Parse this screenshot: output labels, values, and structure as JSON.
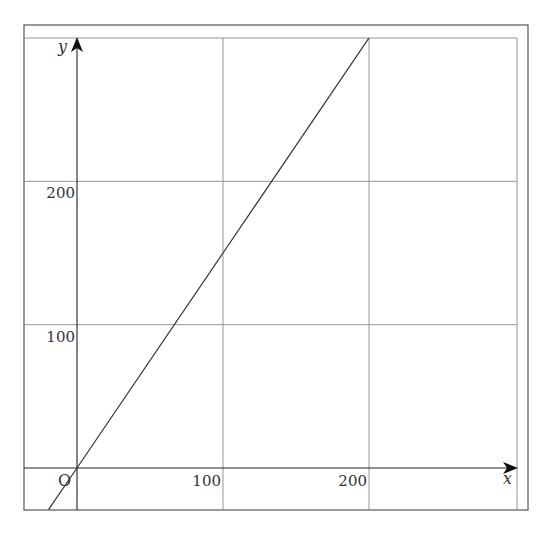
{
  "chart_data": {
    "type": "line",
    "title": "",
    "xlabel": "x",
    "ylabel": "y",
    "origin_label": "O",
    "xlim": [
      -36,
      300
    ],
    "ylim": [
      -29,
      300
    ],
    "x_ticks": [
      100,
      200
    ],
    "y_ticks": [
      100,
      200
    ],
    "x_tick_labels": [
      "100",
      "200"
    ],
    "y_tick_labels": [
      "100",
      "200"
    ],
    "grid": true,
    "legend": null,
    "series": [
      {
        "name": "y = 1.5x",
        "x": [
          -19.5,
          0,
          100,
          200
        ],
        "y": [
          -29,
          0,
          150,
          300
        ]
      }
    ]
  },
  "colors": {
    "line": "#333333",
    "grid": "#8a8a8a",
    "frame": "#555555",
    "axis": "#222222"
  }
}
